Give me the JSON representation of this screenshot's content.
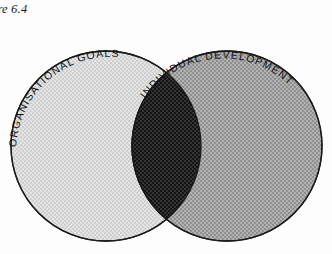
{
  "figure": {
    "caption": "ure 6.4",
    "full_caption": "Figure 6.4"
  },
  "diagram": {
    "type": "venn-two-circle",
    "left_label": "ORGANISATIONAL GOALS",
    "right_label": "INDIVIDUAL DEVELOPMENT",
    "intersection_label": "",
    "colors": {
      "background": "#fdfdfd",
      "outline": "#1a1a1a",
      "left_fill": "#d9d9d9",
      "right_fill": "#a0a0a0",
      "intersection_fill": "#1c1c1c",
      "label_text": "#111111"
    },
    "geometry": {
      "left_circle": {
        "cx": 106,
        "cy": 146,
        "r": 95
      },
      "right_circle": {
        "cx": 227,
        "cy": 146,
        "r": 95
      },
      "lens_left_x": 127,
      "lens_right_x": 215,
      "lens_top_y": 62,
      "lens_bottom_y": 230
    }
  }
}
